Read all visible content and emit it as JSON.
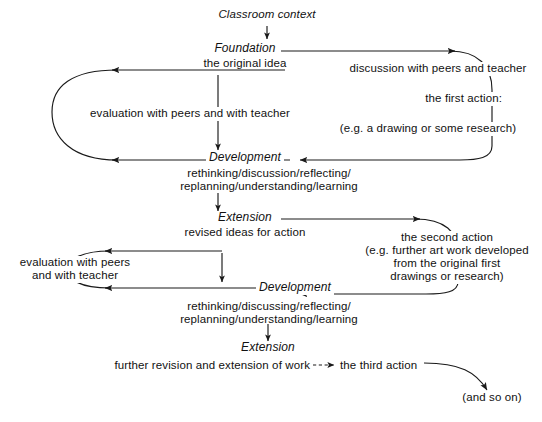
{
  "diagram": {
    "line_color": "#1a1a1a",
    "text_color": "#111111",
    "background": "#ffffff",
    "nodes": {
      "classroom_context": "Classroom context",
      "foundation": "Foundation",
      "foundation_sub": "the original idea",
      "development_1": "Development",
      "development_1_sub_line1": "rethinking/discussion/reflecting/",
      "development_1_sub_line2": "replanning/understanding/learning",
      "extension_1": "Extension",
      "extension_1_sub": "revised ideas for action",
      "development_2": "Development",
      "development_2_sub_line1": "rethinking/discussing/reflecting/",
      "development_2_sub_line2": "replanning/understanding/learning",
      "extension_2": "Extension",
      "extension_2_sub": "further revision and extension of work"
    },
    "edge_labels": {
      "evaluation_top": "evaluation with peers and with teacher",
      "evaluation_bottom_line1": "evaluation with peers",
      "evaluation_bottom_line2": "and with teacher",
      "discussion_top": "discussion with peers and teacher",
      "first_action": "the first action:",
      "first_action_example": "(e.g. a drawing or some research)",
      "second_action_line1": "the second action",
      "second_action_line2": "(e.g. further art work developed",
      "second_action_line3": "from the original first",
      "second_action_line4": "drawings or research)",
      "third_action": "the third action",
      "and_so_on": "(and so on)"
    }
  }
}
